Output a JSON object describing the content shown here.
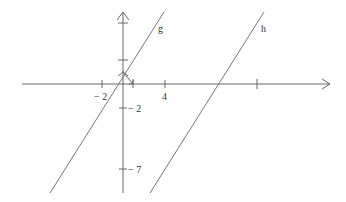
{
  "figure": {
    "type": "coordinate-plane",
    "lines": [
      {
        "name": "g",
        "label": "g"
      },
      {
        "name": "h",
        "label": "h"
      }
    ],
    "x_tick_labels": [
      "− 2",
      "4"
    ],
    "y_tick_labels": [
      "− 2",
      "− 7"
    ],
    "colors": {
      "axis": "#555555",
      "line": "#777777",
      "text": "#333333"
    }
  }
}
